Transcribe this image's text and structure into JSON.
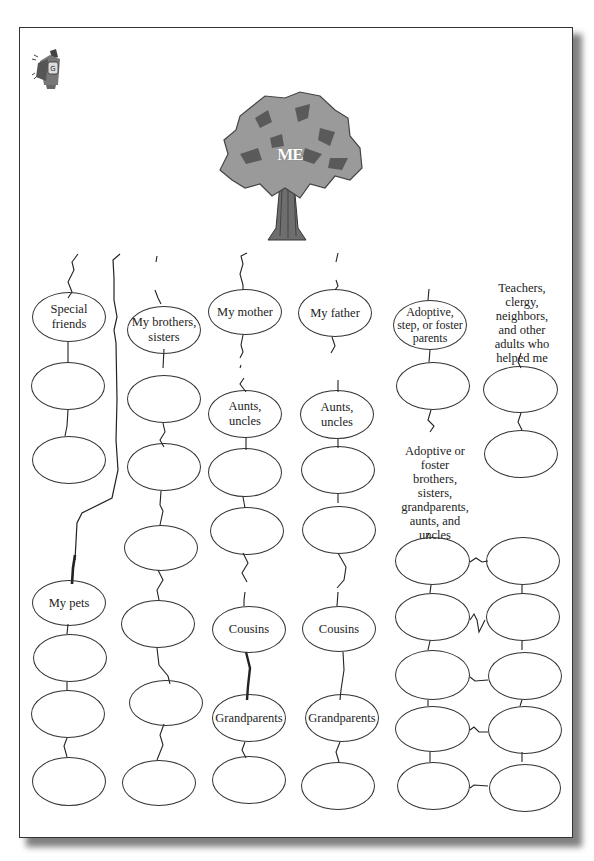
{
  "tree": {
    "label": "ME",
    "icon": "tree-icon"
  },
  "mascot": {
    "icon": "mascot-icon"
  },
  "columns": {
    "friends": {
      "header": "Special friends",
      "header_lines": [
        "Special",
        "friends"
      ],
      "pets_label": "My pets"
    },
    "siblings": {
      "header_lines": [
        "My brothers,",
        "sisters"
      ]
    },
    "mother": {
      "header": "My mother",
      "aunts_lines": [
        "Aunts,",
        "uncles"
      ],
      "cousins": "Cousins",
      "grandparents": "Grandparents"
    },
    "father": {
      "header": "My father",
      "aunts_lines": [
        "Aunts,",
        "uncles"
      ],
      "cousins": "Cousins",
      "grandparents": "Grandparents"
    },
    "adoptive": {
      "header_lines": [
        "Adoptive,",
        "step, or foster",
        "parents"
      ],
      "extended_label_lines": [
        "Adoptive or",
        "foster",
        "brothers,",
        "sisters,",
        "grandparents,",
        "aunts, and",
        "uncles"
      ]
    },
    "mentors": {
      "label_lines": [
        "Teachers,",
        "clergy,",
        "neighbors,",
        "and other",
        "adults who",
        "helped me"
      ]
    }
  },
  "colors": {
    "line": "#222222",
    "border": "#333333",
    "tree_foliage": "#9a9a9a",
    "tree_dark": "#5a5a5a",
    "trunk": "#6e6e6e"
  }
}
